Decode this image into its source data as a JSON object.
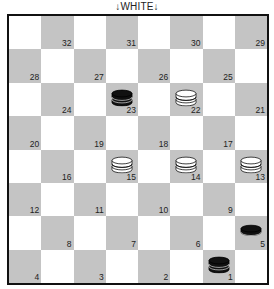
{
  "header": {
    "label": "↓WHITE↓"
  },
  "colors": {
    "dark_square": "#c4c4c4",
    "light_square": "#ffffff",
    "black_piece": "#111111",
    "white_piece": "#ffffff",
    "border": "#111111"
  },
  "board": {
    "rows": [
      [
        {
          "c": "l"
        },
        {
          "c": "d",
          "n": "32"
        },
        {
          "c": "l"
        },
        {
          "c": "d",
          "n": "31"
        },
        {
          "c": "l"
        },
        {
          "c": "d",
          "n": "30"
        },
        {
          "c": "l"
        },
        {
          "c": "d",
          "n": "29"
        }
      ],
      [
        {
          "c": "d",
          "n": "28"
        },
        {
          "c": "l"
        },
        {
          "c": "d",
          "n": "27"
        },
        {
          "c": "l"
        },
        {
          "c": "d",
          "n": "26"
        },
        {
          "c": "l"
        },
        {
          "c": "d",
          "n": "25"
        },
        {
          "c": "l"
        }
      ],
      [
        {
          "c": "l"
        },
        {
          "c": "d",
          "n": "24"
        },
        {
          "c": "l"
        },
        {
          "c": "d",
          "n": "23",
          "p": "black-king"
        },
        {
          "c": "l"
        },
        {
          "c": "d",
          "n": "22",
          "p": "white-king"
        },
        {
          "c": "l"
        },
        {
          "c": "d",
          "n": "21"
        }
      ],
      [
        {
          "c": "d",
          "n": "20"
        },
        {
          "c": "l"
        },
        {
          "c": "d",
          "n": "19"
        },
        {
          "c": "l"
        },
        {
          "c": "d",
          "n": "18"
        },
        {
          "c": "l"
        },
        {
          "c": "d",
          "n": "17"
        },
        {
          "c": "l"
        }
      ],
      [
        {
          "c": "l"
        },
        {
          "c": "d",
          "n": "16"
        },
        {
          "c": "l"
        },
        {
          "c": "d",
          "n": "15",
          "p": "white-king"
        },
        {
          "c": "l"
        },
        {
          "c": "d",
          "n": "14",
          "p": "white-king"
        },
        {
          "c": "l"
        },
        {
          "c": "d",
          "n": "13",
          "p": "white-king"
        }
      ],
      [
        {
          "c": "d",
          "n": "12"
        },
        {
          "c": "l"
        },
        {
          "c": "d",
          "n": "11"
        },
        {
          "c": "l"
        },
        {
          "c": "d",
          "n": "10"
        },
        {
          "c": "l"
        },
        {
          "c": "d",
          "n": "9"
        },
        {
          "c": "l"
        }
      ],
      [
        {
          "c": "l"
        },
        {
          "c": "d",
          "n": "8"
        },
        {
          "c": "l"
        },
        {
          "c": "d",
          "n": "7"
        },
        {
          "c": "l"
        },
        {
          "c": "d",
          "n": "6"
        },
        {
          "c": "l"
        },
        {
          "c": "d",
          "n": "5",
          "p": "black-man"
        }
      ],
      [
        {
          "c": "d",
          "n": "4"
        },
        {
          "c": "l"
        },
        {
          "c": "d",
          "n": "3"
        },
        {
          "c": "l"
        },
        {
          "c": "d",
          "n": "2"
        },
        {
          "c": "l"
        },
        {
          "c": "d",
          "n": "1",
          "p": "black-king"
        },
        {
          "c": "l"
        }
      ]
    ]
  },
  "pieces": [
    {
      "square": "23",
      "color": "black",
      "type": "king"
    },
    {
      "square": "22",
      "color": "white",
      "type": "king"
    },
    {
      "square": "15",
      "color": "white",
      "type": "king"
    },
    {
      "square": "14",
      "color": "white",
      "type": "king"
    },
    {
      "square": "13",
      "color": "white",
      "type": "king"
    },
    {
      "square": "5",
      "color": "black",
      "type": "man"
    },
    {
      "square": "1",
      "color": "black",
      "type": "king"
    }
  ]
}
